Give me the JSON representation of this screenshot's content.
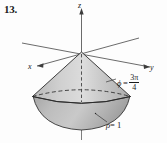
{
  "figure": {
    "problem_number": "13.",
    "caption_text": "",
    "axes": {
      "z_label": "z",
      "x_label": "x",
      "y_label": "y"
    },
    "annotations": {
      "phi": {
        "symbol": "ϕ",
        "equals": "=",
        "numerator": "3π",
        "denominator": "4",
        "full_text": "ϕ = 3π/4"
      },
      "rho": {
        "symbol": "ρ",
        "equals_value": "= 1",
        "full_text": "ρ = 1"
      }
    },
    "colors": {
      "cone_fill": "#c8c8c8",
      "cone_fill_light": "#dedede",
      "cap_fill": "#b4b4b4",
      "outline": "#2a2a2a",
      "axis": "#555555",
      "background": "#fdfdfd",
      "text": "#1a1a1a"
    },
    "shapes": {
      "solid_description": "ice-cream-cone solid: downward cone from origin apex with spherical cap base",
      "cone_apex": "origin",
      "rim_ellipse_style": "dashed back half, solid front half",
      "cap_boundary_style": "solid"
    }
  }
}
